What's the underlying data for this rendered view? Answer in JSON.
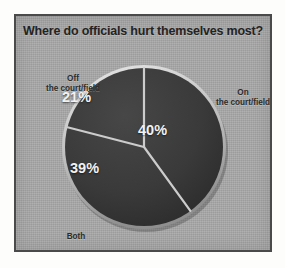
{
  "figure": {
    "title": "Where do officials hurt themselves most?",
    "frame_color": "#4a4a4a",
    "background_color": "#a9a9a9"
  },
  "chart_data": {
    "type": "pie",
    "title": "Where do officials hurt themselves most?",
    "categories": [
      "On the court/field",
      "Both",
      "Off the court/field"
    ],
    "values": [
      40,
      39,
      21
    ],
    "value_labels": [
      "40%",
      "39%",
      "21%"
    ],
    "unit": "percent",
    "total": 100,
    "slice_color": "#3a3a3a",
    "separator_color": "#c9c9c9",
    "label_color": "#2b2b2b",
    "value_text_color": "#f2f2f2",
    "legend": "none",
    "legend_position": "labels-outside",
    "grid": false,
    "start_angle_deg": 0,
    "direction": "clockwise",
    "slices": [
      {
        "label": "On the court/field",
        "value": 40,
        "value_label": "40%"
      },
      {
        "label": "Both",
        "value": 39,
        "value_label": "39%"
      },
      {
        "label": "Off the court/field",
        "value": 21,
        "value_label": "21%"
      }
    ]
  }
}
